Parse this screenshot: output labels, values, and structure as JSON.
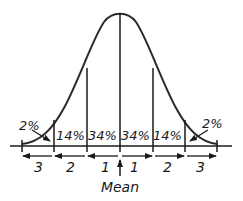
{
  "diagram": {
    "type": "normal-distribution",
    "regions": [
      {
        "label": "2%",
        "side": "left-tail"
      },
      {
        "label": "14%",
        "side": "left"
      },
      {
        "label": "34%",
        "side": "left-center"
      },
      {
        "label": "34%",
        "side": "right-center"
      },
      {
        "label": "14%",
        "side": "right"
      },
      {
        "label": "2%",
        "side": "right-tail"
      }
    ],
    "sd_labels": [
      "3",
      "2",
      "1",
      "1",
      "2",
      "3"
    ],
    "mean_label": "Mean",
    "colors": {
      "line": "#2a2a2a",
      "background": "#ffffff"
    }
  }
}
